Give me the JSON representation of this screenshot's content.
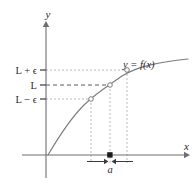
{
  "figure": {
    "background_color": "#ffffff"
  },
  "axes": {
    "x_label": "x",
    "y_label": "y",
    "axis_color": "#6e6e73",
    "origin": {
      "x": 46,
      "y": 155
    },
    "x_axis_end": {
      "x": 186,
      "y": 155
    },
    "y_axis_end": {
      "x": 46,
      "y": 22
    }
  },
  "y_ticks": [
    {
      "id": "tick-l-plus-eps",
      "label": "L + ϵ",
      "y": 70
    },
    {
      "id": "tick-l",
      "label": "L",
      "y": 85
    },
    {
      "id": "tick-l-minus-eps",
      "label": "L − ϵ",
      "y": 99
    }
  ],
  "x_marks": [
    {
      "id": "x-left-bound",
      "x": 91
    },
    {
      "id": "x-a",
      "x": 110,
      "label": "a"
    },
    {
      "id": "x-right-bound",
      "x": 127
    }
  ],
  "curve": {
    "label": "y = f(x)",
    "color": "#7b7b80",
    "label_position": {
      "x": 124,
      "y": 66
    }
  },
  "points": [
    {
      "id": "point-lower",
      "x": 91,
      "y": 99,
      "style": "open"
    },
    {
      "id": "point-limit",
      "x": 110,
      "y": 85,
      "style": "open"
    },
    {
      "id": "point-upper",
      "x": 127,
      "y": 70,
      "style": "open"
    }
  ],
  "delta_marker": {
    "label": "a",
    "dot_x": 110,
    "dot_y": 155,
    "left_arrow_from": 88,
    "left_arrow_to": 106,
    "right_arrow_from": 132,
    "right_arrow_to": 114,
    "label_position": {
      "x": 110,
      "y": 172
    }
  },
  "colors": {
    "guide_line": "#b9b9bd",
    "limit_line": "#4a4a4f",
    "curve": "#7b7b80",
    "axis": "#6e6e73",
    "text": "#2a2a2a"
  }
}
